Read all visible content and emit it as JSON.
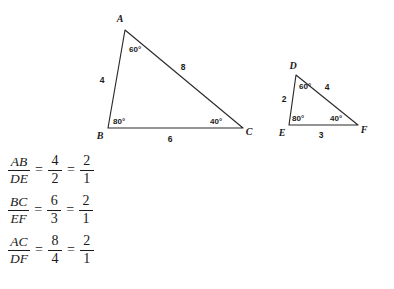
{
  "figure": {
    "stroke_color": "#2b2b2b",
    "text_color": "#1a1a1a",
    "background_color": "#ffffff",
    "large_triangle": {
      "name": "triangle-abc",
      "vertices": [
        {
          "label": "A",
          "x": 125,
          "y": 30
        },
        {
          "label": "B",
          "x": 108,
          "y": 128
        },
        {
          "label": "C",
          "x": 243,
          "y": 128
        }
      ],
      "vertex_label_positions": [
        {
          "label": "A",
          "x": 120,
          "y": 22
        },
        {
          "label": "B",
          "x": 100,
          "y": 139
        },
        {
          "label": "C",
          "x": 248,
          "y": 135
        }
      ],
      "angles": [
        {
          "at": "A",
          "value": "60°",
          "x": 129,
          "y": 52
        },
        {
          "at": "B",
          "value": "80°",
          "x": 114,
          "y": 124
        },
        {
          "at": "C",
          "value": "40°",
          "x": 212,
          "y": 124
        }
      ],
      "sides": [
        {
          "name": "AB",
          "value": "4",
          "x": 102,
          "y": 82
        },
        {
          "name": "AC",
          "value": "8",
          "x": 181,
          "y": 70
        },
        {
          "name": "BC",
          "value": "6",
          "x": 170,
          "y": 141
        }
      ]
    },
    "small_triangle": {
      "name": "triangle-def",
      "vertices": [
        {
          "label": "D",
          "x": 296,
          "y": 75
        },
        {
          "label": "E",
          "x": 289,
          "y": 125
        },
        {
          "label": "F",
          "x": 358,
          "y": 125
        }
      ],
      "vertex_label_positions": [
        {
          "label": "D",
          "x": 292,
          "y": 69
        },
        {
          "label": "E",
          "x": 281,
          "y": 136
        },
        {
          "label": "F",
          "x": 362,
          "y": 133
        }
      ],
      "angles": [
        {
          "at": "D",
          "value": "60°",
          "x": 299,
          "y": 88
        },
        {
          "at": "E",
          "value": "80°",
          "x": 293,
          "y": 121
        },
        {
          "at": "F",
          "value": "40°",
          "x": 331,
          "y": 121
        }
      ],
      "sides": [
        {
          "name": "DE",
          "value": "2",
          "x": 283,
          "y": 101
        },
        {
          "name": "DF",
          "value": "4",
          "x": 325,
          "y": 89
        },
        {
          "name": "EF",
          "value": "3",
          "x": 320,
          "y": 137
        }
      ]
    }
  },
  "equations": [
    {
      "id": "ratio-ab-de",
      "left": {
        "numerator": "AB",
        "denominator": "DE"
      },
      "middle": {
        "numerator": "4",
        "denominator": "2"
      },
      "right": {
        "numerator": "2",
        "denominator": "1"
      },
      "equals_1": "=",
      "equals_2": "="
    },
    {
      "id": "ratio-bc-ef",
      "left": {
        "numerator": "BC",
        "denominator": "EF"
      },
      "middle": {
        "numerator": "6",
        "denominator": "3"
      },
      "right": {
        "numerator": "2",
        "denominator": "1"
      },
      "equals_1": "=",
      "equals_2": "="
    },
    {
      "id": "ratio-ac-df",
      "left": {
        "numerator": "AC",
        "denominator": "DF"
      },
      "middle": {
        "numerator": "8",
        "denominator": "4"
      },
      "right": {
        "numerator": "2",
        "denominator": "1"
      },
      "equals_1": "=",
      "equals_2": "="
    }
  ]
}
